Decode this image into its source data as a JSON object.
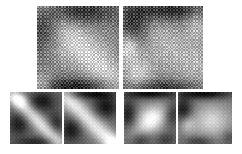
{
  "figure": {
    "title": "",
    "background_color": "#ffffff",
    "width": 242,
    "height": 154,
    "colormap": "grayscale",
    "panel_count": 6
  },
  "chart_data": {
    "type": "heatmap",
    "title": "",
    "subtitle": "",
    "xlabel": "",
    "ylabel": "",
    "grid": false,
    "legend_position": "none",
    "colormap": {
      "name": "grayscale",
      "low_color": "#000000",
      "high_color": "#ffffff",
      "vmin": 0,
      "vmax": 1
    },
    "layout": {
      "rows": 2,
      "top_row_panels": 2,
      "bottom_row_panels": 4
    },
    "panels": [
      {
        "id": "top-left",
        "label": "",
        "row": 1,
        "column": 1,
        "x": 37,
        "y": 6,
        "width": 82,
        "height": 83,
        "grid_size": 48,
        "texture": "checkerboard-lattice",
        "texture_amplitude": 0.17,
        "description": "Large block-structured matrix; dark band along upper-left and lower edge, bright diagonal ridge running from upper-left toward lower-right.",
        "field": {
          "model": "ridge-blobs",
          "base": 0.46,
          "features": [
            {
              "type": "ridge",
              "x0": 0.1,
              "y0": 0.06,
              "x1": 0.95,
              "y1": 0.92,
              "width": 0.22,
              "amp": 0.34
            },
            {
              "type": "blob",
              "cx": 0.1,
              "cy": 0.2,
              "rx": 0.22,
              "ry": 0.26,
              "amp": -0.36
            },
            {
              "type": "blob",
              "cx": 0.52,
              "cy": 0.08,
              "rx": 0.4,
              "ry": 0.13,
              "amp": -0.3
            },
            {
              "type": "blob",
              "cx": 0.5,
              "cy": 0.97,
              "rx": 0.5,
              "ry": 0.1,
              "amp": -0.34
            },
            {
              "type": "blob",
              "cx": 0.05,
              "cy": 0.95,
              "rx": 0.14,
              "ry": 0.14,
              "amp": 0.32
            },
            {
              "type": "blob",
              "cx": 0.82,
              "cy": 0.45,
              "rx": 0.25,
              "ry": 0.3,
              "amp": 0.08
            },
            {
              "type": "blob",
              "cx": 0.3,
              "cy": 0.6,
              "rx": 0.22,
              "ry": 0.25,
              "amp": 0.1
            }
          ]
        }
      },
      {
        "id": "top-right",
        "label": "",
        "row": 1,
        "column": 2,
        "x": 123,
        "y": 6,
        "width": 80,
        "height": 83,
        "grid_size": 48,
        "texture": "checkerboard-lattice",
        "texture_amplitude": 0.17,
        "description": "Large block-structured matrix; strong dark patch in upper-left quadrant and dark top band, bright plateau through center-right and along left-lower edge.",
        "field": {
          "model": "ridge-blobs",
          "base": 0.5,
          "features": [
            {
              "type": "blob",
              "cx": 0.14,
              "cy": 0.26,
              "rx": 0.2,
              "ry": 0.26,
              "amp": -0.42
            },
            {
              "type": "blob",
              "cx": 0.58,
              "cy": 0.06,
              "rx": 0.42,
              "ry": 0.12,
              "amp": -0.36
            },
            {
              "type": "blob",
              "cx": 0.5,
              "cy": 0.98,
              "rx": 0.48,
              "ry": 0.09,
              "amp": -0.3
            },
            {
              "type": "blob",
              "cx": 0.07,
              "cy": 0.5,
              "rx": 0.12,
              "ry": 0.16,
              "amp": 0.38
            },
            {
              "type": "blob",
              "cx": 0.18,
              "cy": 0.82,
              "rx": 0.18,
              "ry": 0.18,
              "amp": 0.3
            },
            {
              "type": "ridge",
              "x0": 0.25,
              "y0": 0.35,
              "x1": 0.95,
              "y1": 0.7,
              "width": 0.3,
              "amp": 0.22
            },
            {
              "type": "blob",
              "cx": 0.92,
              "cy": 0.22,
              "rx": 0.14,
              "ry": 0.18,
              "amp": 0.2
            }
          ]
        }
      },
      {
        "id": "bottom-1",
        "label": "",
        "row": 2,
        "column": 1,
        "x": 10,
        "y": 92,
        "width": 52,
        "height": 52,
        "grid_size": 28,
        "texture": "fine-lattice",
        "texture_amplitude": 0.07,
        "description": "Smooth kernel map; bright narrow diagonal streak from upper-left to lower-right with dark lobes above-right and below-left.",
        "field": {
          "model": "ridge-blobs",
          "base": 0.42,
          "features": [
            {
              "type": "ridge",
              "x0": 0.08,
              "y0": 0.1,
              "x1": 0.92,
              "y1": 0.95,
              "width": 0.14,
              "amp": 0.48
            },
            {
              "type": "blob",
              "cx": 0.2,
              "cy": 0.16,
              "rx": 0.14,
              "ry": 0.12,
              "amp": 0.34
            },
            {
              "type": "blob",
              "cx": 0.62,
              "cy": 0.18,
              "rx": 0.26,
              "ry": 0.2,
              "amp": -0.32
            },
            {
              "type": "blob",
              "cx": 0.16,
              "cy": 0.62,
              "rx": 0.2,
              "ry": 0.22,
              "amp": -0.3
            },
            {
              "type": "blob",
              "cx": 0.88,
              "cy": 0.6,
              "rx": 0.16,
              "ry": 0.22,
              "amp": -0.24
            },
            {
              "type": "blob",
              "cx": 0.5,
              "cy": 0.96,
              "rx": 0.4,
              "ry": 0.1,
              "amp": -0.26
            }
          ]
        }
      },
      {
        "id": "bottom-2",
        "label": "",
        "row": 2,
        "column": 2,
        "x": 64,
        "y": 92,
        "width": 52,
        "height": 52,
        "grid_size": 28,
        "texture": "fine-lattice",
        "texture_amplitude": 0.07,
        "description": "Smooth kernel map; broad bright diagonal band from upper-left to lower-right, dark corners upper-right and lower-left, dark top band.",
        "field": {
          "model": "ridge-blobs",
          "base": 0.42,
          "features": [
            {
              "type": "ridge",
              "x0": 0.05,
              "y0": 0.12,
              "x1": 0.95,
              "y1": 1.0,
              "width": 0.18,
              "amp": 0.5
            },
            {
              "type": "blob",
              "cx": 0.5,
              "cy": 0.04,
              "rx": 0.46,
              "ry": 0.09,
              "amp": -0.34
            },
            {
              "type": "blob",
              "cx": 0.8,
              "cy": 0.28,
              "rx": 0.24,
              "ry": 0.22,
              "amp": -0.34
            },
            {
              "type": "blob",
              "cx": 0.14,
              "cy": 0.72,
              "rx": 0.2,
              "ry": 0.24,
              "amp": -0.32
            },
            {
              "type": "blob",
              "cx": 0.95,
              "cy": 0.95,
              "rx": 0.16,
              "ry": 0.14,
              "amp": 0.22
            }
          ]
        }
      },
      {
        "id": "bottom-3",
        "label": "",
        "row": 2,
        "column": 3,
        "x": 124,
        "y": 92,
        "width": 52,
        "height": 52,
        "grid_size": 28,
        "texture": "fine-lattice",
        "texture_amplitude": 0.07,
        "description": "Smooth kernel map; bright blob in the centre with dark band across the top, dark lobes at left and right edges.",
        "field": {
          "model": "ridge-blobs",
          "base": 0.46,
          "features": [
            {
              "type": "blob",
              "cx": 0.52,
              "cy": 0.52,
              "rx": 0.26,
              "ry": 0.26,
              "amp": 0.4
            },
            {
              "type": "blob",
              "cx": 0.5,
              "cy": 0.03,
              "rx": 0.48,
              "ry": 0.1,
              "amp": -0.44
            },
            {
              "type": "blob",
              "cx": 0.08,
              "cy": 0.42,
              "rx": 0.16,
              "ry": 0.28,
              "amp": -0.34
            },
            {
              "type": "blob",
              "cx": 0.92,
              "cy": 0.38,
              "rx": 0.16,
              "ry": 0.28,
              "amp": -0.32
            },
            {
              "type": "blob",
              "cx": 0.3,
              "cy": 0.92,
              "rx": 0.2,
              "ry": 0.14,
              "amp": -0.26
            },
            {
              "type": "blob",
              "cx": 0.8,
              "cy": 0.92,
              "rx": 0.2,
              "ry": 0.14,
              "amp": -0.22
            },
            {
              "type": "ridge",
              "x0": 0.2,
              "y0": 0.8,
              "x1": 0.85,
              "y1": 0.28,
              "width": 0.18,
              "amp": 0.18
            }
          ]
        }
      },
      {
        "id": "bottom-4",
        "label": "",
        "row": 2,
        "column": 4,
        "x": 178,
        "y": 92,
        "width": 54,
        "height": 52,
        "grid_size": 28,
        "texture": "fine-lattice",
        "texture_amplitude": 0.07,
        "description": "Smooth kernel map; dark band across the top and a dark lobe on the left, broad bright plateau filling the centre and right.",
        "field": {
          "model": "ridge-blobs",
          "base": 0.48,
          "features": [
            {
              "type": "blob",
              "cx": 0.5,
              "cy": 0.03,
              "rx": 0.5,
              "ry": 0.11,
              "amp": -0.46
            },
            {
              "type": "blob",
              "cx": 0.1,
              "cy": 0.34,
              "rx": 0.17,
              "ry": 0.24,
              "amp": -0.38
            },
            {
              "type": "blob",
              "cx": 0.62,
              "cy": 0.55,
              "rx": 0.34,
              "ry": 0.3,
              "amp": 0.36
            },
            {
              "type": "blob",
              "cx": 0.18,
              "cy": 0.62,
              "rx": 0.14,
              "ry": 0.16,
              "amp": 0.26
            },
            {
              "type": "blob",
              "cx": 0.4,
              "cy": 0.95,
              "rx": 0.26,
              "ry": 0.1,
              "amp": -0.26
            },
            {
              "type": "blob",
              "cx": 0.95,
              "cy": 0.88,
              "rx": 0.14,
              "ry": 0.16,
              "amp": -0.18
            }
          ]
        }
      }
    ]
  }
}
